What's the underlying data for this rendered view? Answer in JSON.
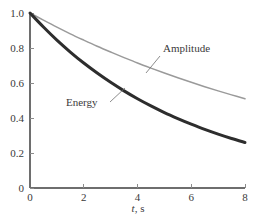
{
  "chart_data": {
    "type": "line",
    "title": "",
    "subtitle": "",
    "xlabel": "t, s",
    "xlabel_symbol": "t",
    "xlabel_unit": ", s",
    "ylabel": "",
    "xlim": [
      0,
      8
    ],
    "ylim": [
      0,
      1.0
    ],
    "grid": false,
    "legend": "inline-annotations",
    "xticks": [
      0,
      2,
      4,
      6,
      8
    ],
    "xtick_labels": [
      "0",
      "2",
      "4",
      "6",
      "8"
    ],
    "yticks": [
      0,
      0.2,
      0.4,
      0.6,
      0.8,
      1.0
    ],
    "ytick_labels": [
      "0",
      "0.2",
      "0.4",
      "0.6",
      "0.8",
      "1.0"
    ],
    "x": [
      0,
      0.5,
      1,
      1.5,
      2,
      2.5,
      3,
      3.5,
      4,
      4.5,
      5,
      5.5,
      6,
      6.5,
      7,
      7.5,
      8
    ],
    "series": [
      {
        "name": "Amplitude",
        "color": "#9a9a9a",
        "width": 1.5,
        "values": [
          1.0,
          0.959,
          0.919,
          0.881,
          0.845,
          0.81,
          0.777,
          0.745,
          0.714,
          0.685,
          0.657,
          0.63,
          0.604,
          0.579,
          0.555,
          0.532,
          0.51
        ]
      },
      {
        "name": "Energy",
        "color": "#2d2d2d",
        "width": 3.0,
        "values": [
          1.0,
          0.92,
          0.845,
          0.777,
          0.714,
          0.657,
          0.604,
          0.555,
          0.51,
          0.469,
          0.431,
          0.397,
          0.365,
          0.335,
          0.308,
          0.283,
          0.26
        ]
      }
    ],
    "annotations": [
      {
        "text": "Amplitude",
        "label_x": 163,
        "label_y": 52,
        "leader_from_x": 160,
        "leader_from_y": 56,
        "leader_to_x": 146,
        "leader_to_y": 73
      },
      {
        "text": "Energy",
        "label_x": 66,
        "label_y": 106,
        "leader_from_x": 110,
        "leader_from_y": 102,
        "leader_to_x": 125,
        "leader_to_y": 88
      }
    ]
  },
  "axes": {
    "x_title": "t, s",
    "x_title_symbol": "t",
    "x_title_rest": ", s"
  }
}
